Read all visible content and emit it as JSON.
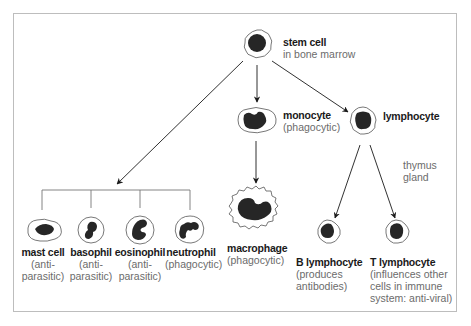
{
  "colors": {
    "ink": "#1a1a1a",
    "nucleus": "#262626",
    "membrane": "#555555",
    "desc_text": "#6b6b6b",
    "frame": "#bdbdbd"
  },
  "nodes": {
    "stem_cell": {
      "name": "stem cell",
      "desc": "in bone marrow"
    },
    "monocyte": {
      "name": "monocyte",
      "desc": "(phagocytic)"
    },
    "lymphocyte": {
      "name": "lymphocyte"
    },
    "macrophage": {
      "name": "macrophage",
      "desc": "(phagocytic)"
    },
    "mast_cell": {
      "name": "mast cell",
      "desc1": "(anti-",
      "desc2": "parasitic)"
    },
    "basophil": {
      "name": "basophil",
      "desc1": "(anti-",
      "desc2": "parasitic)"
    },
    "eosinophil": {
      "name": "eosinophil",
      "desc1": "(anti-",
      "desc2": "parasitic)"
    },
    "neutrophil": {
      "name": "neutrophil",
      "desc1": "(phagocytic)"
    },
    "b_lymphocyte": {
      "name": "B lymphocyte",
      "desc1": "(produces",
      "desc2": "antibodies)"
    },
    "t_lymphocyte": {
      "name": "T lymphocyte",
      "desc1": "(influences other",
      "desc2": "cells in immune",
      "desc3": "system: anti-viral)"
    }
  },
  "annotations": {
    "thymus_line1": "thymus",
    "thymus_line2": "gland"
  },
  "edges": [
    {
      "from": "stem cell",
      "to": "granulocytes group"
    },
    {
      "from": "stem cell",
      "to": "monocyte"
    },
    {
      "from": "stem cell",
      "to": "lymphocyte"
    },
    {
      "from": "monocyte",
      "to": "macrophage"
    },
    {
      "from": "lymphocyte",
      "to": "B lymphocyte"
    },
    {
      "from": "lymphocyte",
      "to": "T lymphocyte"
    },
    {
      "from": "granulocytes group",
      "to": [
        "mast cell",
        "basophil",
        "eosinophil",
        "neutrophil"
      ]
    }
  ]
}
